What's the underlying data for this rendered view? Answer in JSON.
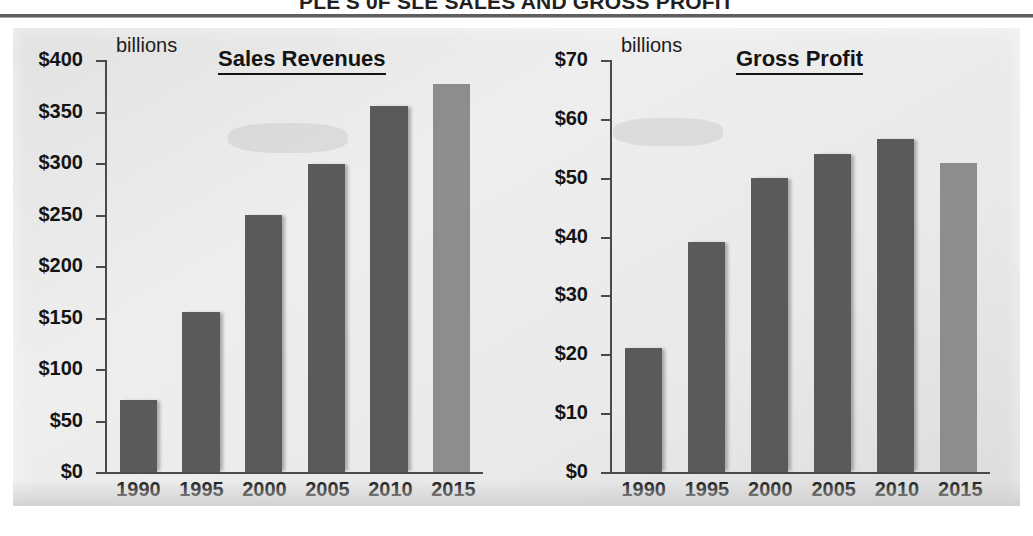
{
  "header": {
    "title": "PLE'S 0F SLE SALES AND GROSS PROFIT",
    "rule": "horizontal-rule"
  },
  "charts": [
    {
      "id": "sales",
      "title": "Sales Revenues",
      "units_label": "billions",
      "y_ticks": [
        "$400",
        "$350",
        "$300",
        "$250",
        "$200",
        "$150",
        "$100",
        "$50",
        "$0"
      ],
      "x_labels": [
        "1990",
        "1995",
        "2000",
        "2005",
        "2010",
        "2015"
      ]
    },
    {
      "id": "profit",
      "title": "Gross Profit",
      "units_label": "billions",
      "y_ticks": [
        "$70",
        "$60",
        "$50",
        "$40",
        "$30",
        "$20",
        "$10",
        "$0"
      ],
      "x_labels": [
        "1990",
        "1995",
        "2000",
        "2005",
        "2010",
        "2015"
      ]
    }
  ],
  "colors": {
    "bar_dark": "#5a5a5a",
    "bar_light": "#8d8d8d",
    "panel_background": "#e9e9e9",
    "axis": "#4a4a4a",
    "text": "#141414"
  },
  "chart_data": [
    {
      "type": "bar",
      "id": "sales",
      "title": "Sales Revenues",
      "subtitle": "billions",
      "xlabel": "",
      "ylabel": "billions",
      "categories": [
        "1990",
        "1995",
        "2000",
        "2005",
        "2010",
        "2015"
      ],
      "values": [
        70,
        155,
        250,
        299,
        355,
        377
      ],
      "ylim": [
        0,
        400
      ],
      "ytick_step": 50,
      "ytick_labels": [
        "$0",
        "$50",
        "$100",
        "$150",
        "$200",
        "$250",
        "$300",
        "$350",
        "$400"
      ],
      "grid": false,
      "legend": "none",
      "bar_colors": [
        "#5a5a5a",
        "#5a5a5a",
        "#5a5a5a",
        "#5a5a5a",
        "#5a5a5a",
        "#8d8d8d"
      ]
    },
    {
      "type": "bar",
      "id": "profit",
      "title": "Gross Profit",
      "subtitle": "billions",
      "xlabel": "",
      "ylabel": "billions",
      "categories": [
        "1990",
        "1995",
        "2000",
        "2005",
        "2010",
        "2015"
      ],
      "values": [
        21,
        39,
        50,
        54,
        56.5,
        52.5
      ],
      "ylim": [
        0,
        70
      ],
      "ytick_step": 10,
      "ytick_labels": [
        "$0",
        "$10",
        "$20",
        "$30",
        "$40",
        "$50",
        "$60",
        "$70"
      ],
      "grid": false,
      "legend": "none",
      "bar_colors": [
        "#5a5a5a",
        "#5a5a5a",
        "#5a5a5a",
        "#5a5a5a",
        "#5a5a5a",
        "#8d8d8d"
      ]
    }
  ]
}
